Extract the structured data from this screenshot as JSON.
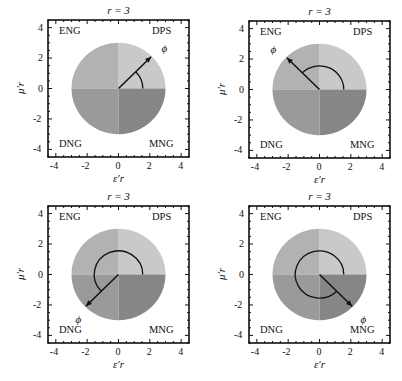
{
  "figure": {
    "panels": [
      {
        "title": "r = 3",
        "phi_label": "ϕ",
        "phi_deg": 45,
        "x_label": "ε′r",
        "y_label": "μ′r"
      },
      {
        "title": "r = 3",
        "phi_label": "ϕ",
        "phi_deg": 135,
        "x_label": "ε′r",
        "y_label": "μ′r"
      },
      {
        "title": "r = 3",
        "phi_label": "ϕ",
        "phi_deg": 225,
        "x_label": "ε′r",
        "y_label": "μ′r"
      },
      {
        "title": "r = 3",
        "phi_label": "ϕ",
        "phi_deg": 315,
        "x_label": "ε′r",
        "y_label": "μ′r"
      }
    ],
    "regions": {
      "top_left": "ENG",
      "top_right": "DPS",
      "bottom_left": "DNG",
      "bottom_right": "MNG"
    },
    "ticks": [
      "-4",
      "-2",
      "0",
      "2",
      "4"
    ],
    "colors": {
      "ENG": "#b2b2b2",
      "DPS": "#c9c9c9",
      "DNG": "#9a9a9a",
      "MNG": "#868686",
      "line": "#111111"
    }
  },
  "chart_data": [
    {
      "type": "diagram-polar",
      "title": "r = 3",
      "xlabel": "ε′r",
      "ylabel": "μ′r",
      "xlim": [
        -4.5,
        4.5
      ],
      "ylim": [
        -4.5,
        4.5
      ],
      "circle_radius": 3,
      "phi_deg": 45,
      "arrow_tip": [
        2.1,
        2.1
      ],
      "arc_radius": 1.5,
      "quadrant_labels": [
        "ENG",
        "DPS",
        "DNG",
        "MNG"
      ],
      "xticks": [
        -4,
        -2,
        0,
        2,
        4
      ],
      "yticks": [
        -4,
        -2,
        0,
        2,
        4
      ]
    },
    {
      "type": "diagram-polar",
      "title": "r = 3",
      "xlabel": "ε′r",
      "ylabel": "μ′r",
      "xlim": [
        -4.5,
        4.5
      ],
      "ylim": [
        -4.5,
        4.5
      ],
      "circle_radius": 3,
      "phi_deg": 135,
      "arrow_tip": [
        -2.1,
        2.1
      ],
      "arc_radius": 1.5,
      "quadrant_labels": [
        "ENG",
        "DPS",
        "DNG",
        "MNG"
      ],
      "xticks": [
        -4,
        -2,
        0,
        2,
        4
      ],
      "yticks": [
        -4,
        -2,
        0,
        2,
        4
      ]
    },
    {
      "type": "diagram-polar",
      "title": "r = 3",
      "xlabel": "ε′r",
      "ylabel": "μ′r",
      "xlim": [
        -4.5,
        4.5
      ],
      "ylim": [
        -4.5,
        4.5
      ],
      "circle_radius": 3,
      "phi_deg": 225,
      "arrow_tip": [
        -2.1,
        -2.1
      ],
      "arc_radius": 1.5,
      "quadrant_labels": [
        "ENG",
        "DPS",
        "DNG",
        "MNG"
      ],
      "xticks": [
        -4,
        -2,
        0,
        2,
        4
      ],
      "yticks": [
        -4,
        -2,
        0,
        2,
        4
      ]
    },
    {
      "type": "diagram-polar",
      "title": "r = 3",
      "xlabel": "ε′r",
      "ylabel": "μ′r",
      "xlim": [
        -4.5,
        4.5
      ],
      "ylim": [
        -4.5,
        4.5
      ],
      "circle_radius": 3,
      "phi_deg": 315,
      "arrow_tip": [
        2.1,
        -2.1
      ],
      "arc_radius": 1.5,
      "quadrant_labels": [
        "ENG",
        "DPS",
        "DNG",
        "MNG"
      ],
      "xticks": [
        -4,
        -2,
        0,
        2,
        4
      ],
      "yticks": [
        -4,
        -2,
        0,
        2,
        4
      ]
    }
  ]
}
